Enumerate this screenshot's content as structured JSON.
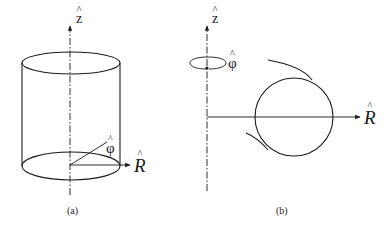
{
  "figure": {
    "panels": [
      {
        "id": "a",
        "caption": "(a)",
        "description": "Cylinder with vertical z-axis, showing unit vectors R-hat and phi-hat at base",
        "labels": {
          "z": "z",
          "phi": "φ",
          "R": "R",
          "hat": "^"
        }
      },
      {
        "id": "b",
        "caption": "(b)",
        "description": "Circular loop in R-z plane, with phi-hat rotation indicated around z-axis",
        "labels": {
          "z": "z",
          "phi": "φ",
          "R": "R",
          "hat": "^"
        }
      }
    ],
    "colors": {
      "ink": "#1a1a1a",
      "background": "#ffffff"
    }
  }
}
